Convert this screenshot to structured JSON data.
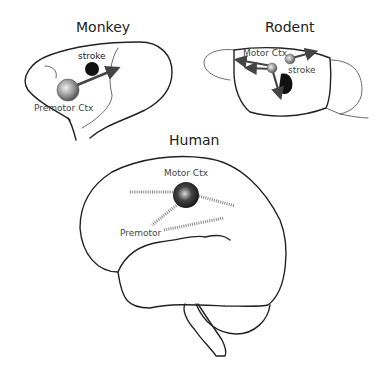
{
  "panels": {
    "monkey": {
      "title": "Monkey",
      "labels": {
        "stroke": "stroke",
        "region": "Premotor Ctx"
      }
    },
    "rodent": {
      "title": "Rodent",
      "labels": {
        "region": "Motor Ctx",
        "stroke": "stroke"
      }
    },
    "human": {
      "title": "Human",
      "labels": {
        "region": "Motor Ctx",
        "secondary": "Premotor"
      }
    }
  },
  "colors": {
    "outline": "#222222",
    "stroke_lesion": "#111111",
    "arrow": "#444444",
    "hatch": "#888888"
  }
}
